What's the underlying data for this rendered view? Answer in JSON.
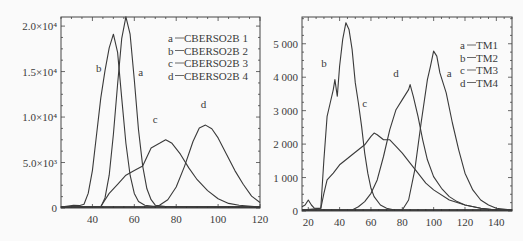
{
  "chart_data": [
    {
      "type": "line",
      "title": "",
      "xlabel": "",
      "ylabel": "",
      "xlim": [
        25,
        120
      ],
      "ylim": [
        0,
        21000
      ],
      "x_ticks": [
        40,
        60,
        80,
        100,
        120
      ],
      "y_ticks": [
        {
          "value": 0,
          "label": "0"
        },
        {
          "value": 5000,
          "label": "5.0×10³"
        },
        {
          "value": 10000,
          "label": "1.0×10⁴"
        },
        {
          "value": 15000,
          "label": "1.5×10⁴"
        },
        {
          "value": 20000,
          "label": "2.0×10⁴"
        }
      ],
      "grid": false,
      "legend_position": "upper right",
      "legend": [
        {
          "key": "a",
          "text": "CBERSO2B 1"
        },
        {
          "key": "b",
          "text": "CBERSO2B 2"
        },
        {
          "key": "c",
          "text": "CBERSO2B 3"
        },
        {
          "key": "d",
          "text": "CBERSO2B 4"
        }
      ],
      "series": [
        {
          "name": "a",
          "label": "CBERSO2B 1",
          "label_pos": [
            63,
            14500
          ],
          "x": [
            25,
            44,
            46,
            48,
            50,
            52,
            54,
            56,
            58,
            60,
            62,
            64,
            66,
            68,
            70,
            75,
            120
          ],
          "values": [
            0,
            0,
            1000,
            3500,
            8000,
            13500,
            18500,
            20900,
            19000,
            14000,
            8500,
            4500,
            2000,
            800,
            200,
            50,
            0
          ]
        },
        {
          "name": "b",
          "label": "CBERSO2B 2",
          "label_pos": [
            43,
            15000
          ],
          "x": [
            25,
            31,
            34,
            36,
            38,
            40,
            42,
            44,
            46,
            48,
            50,
            52,
            54,
            56,
            58,
            60,
            62,
            65,
            70,
            120
          ],
          "values": [
            0,
            200,
            150,
            300,
            1500,
            4000,
            8000,
            12000,
            15000,
            17500,
            19000,
            17000,
            12000,
            7000,
            3500,
            1500,
            600,
            200,
            50,
            0
          ]
        },
        {
          "name": "c",
          "label": "CBERSO2B 3",
          "label_pos": [
            70,
            9300
          ],
          "x": [
            25,
            44,
            48,
            52,
            56,
            60,
            64,
            68,
            72,
            75,
            78,
            82,
            86,
            90,
            95,
            100,
            105,
            110,
            120
          ],
          "values": [
            0,
            50,
            1500,
            2500,
            3500,
            4000,
            4500,
            6500,
            7000,
            7400,
            7000,
            5800,
            4300,
            3000,
            1800,
            900,
            400,
            200,
            0
          ]
        },
        {
          "name": "d",
          "label": "CBERSO2B 4",
          "label_pos": [
            93,
            11000
          ],
          "x": [
            25,
            68,
            72,
            76,
            80,
            84,
            88,
            91,
            94,
            97,
            100,
            104,
            108,
            112,
            116,
            120
          ],
          "values": [
            0,
            0,
            200,
            800,
            2200,
            4500,
            7200,
            8700,
            9000,
            8600,
            7600,
            5800,
            4000,
            2500,
            1200,
            500
          ]
        }
      ]
    },
    {
      "type": "line",
      "title": "",
      "xlabel": "",
      "ylabel": "",
      "xlim": [
        16,
        150
      ],
      "ylim": [
        0,
        5800
      ],
      "x_ticks": [
        20,
        40,
        60,
        80,
        100,
        120,
        140
      ],
      "y_ticks": [
        {
          "value": 0,
          "label": "0"
        },
        {
          "value": 1000,
          "label": "1 000"
        },
        {
          "value": 2000,
          "label": "2 000"
        },
        {
          "value": 3000,
          "label": "3 000"
        },
        {
          "value": 4000,
          "label": "4 000"
        },
        {
          "value": 5000,
          "label": "5 000"
        }
      ],
      "grid": false,
      "legend_position": "upper right",
      "legend": [
        {
          "key": "a",
          "text": "TM1"
        },
        {
          "key": "b",
          "text": "TM2"
        },
        {
          "key": "c",
          "text": "TM3"
        },
        {
          "key": "d",
          "text": "TM4"
        }
      ],
      "series": [
        {
          "name": "a",
          "label": "TM1",
          "label_pos": [
            110,
            4000
          ],
          "x": [
            16,
            80,
            84,
            88,
            92,
            96,
            98,
            100,
            102,
            104,
            108,
            112,
            116,
            120,
            125,
            130,
            135,
            140,
            150
          ],
          "values": [
            0,
            0,
            300,
            1200,
            2600,
            3900,
            4300,
            4750,
            4600,
            4100,
            3500,
            2600,
            1800,
            1100,
            600,
            300,
            150,
            50,
            0
          ]
        },
        {
          "name": "b",
          "label": "TM2",
          "label_pos": [
            30,
            4300
          ],
          "x": [
            16,
            18,
            20,
            22,
            24,
            28,
            30,
            32,
            34,
            36,
            37,
            38.5,
            40,
            42,
            44,
            46,
            48,
            50,
            52,
            54,
            56,
            58,
            60,
            62,
            66,
            70,
            75,
            150
          ],
          "values": [
            100,
            150,
            300,
            150,
            50,
            50,
            1500,
            2800,
            3200,
            3600,
            3900,
            3400,
            4300,
            5100,
            5600,
            5400,
            4800,
            3800,
            3200,
            2500,
            1700,
            1100,
            650,
            400,
            150,
            50,
            0,
            0
          ]
        },
        {
          "name": "c",
          "label": "TM3",
          "label_pos": [
            56,
            3100
          ],
          "x": [
            16,
            28,
            30,
            32,
            36,
            40,
            44,
            48,
            52,
            56,
            60,
            62,
            64,
            68,
            72,
            76,
            80,
            85,
            90,
            95,
            100,
            110,
            120,
            130,
            140,
            150
          ],
          "values": [
            0,
            50,
            500,
            900,
            1100,
            1350,
            1500,
            1650,
            1800,
            1950,
            2200,
            2300,
            2250,
            2100,
            2100,
            1900,
            1700,
            1400,
            1100,
            800,
            600,
            300,
            150,
            50,
            0,
            0
          ]
        },
        {
          "name": "d",
          "label": "TM4",
          "label_pos": [
            76,
            4000
          ],
          "x": [
            16,
            48,
            52,
            56,
            60,
            64,
            68,
            72,
            76,
            80,
            84,
            85,
            87,
            90,
            93,
            96,
            100,
            105,
            110,
            115,
            120,
            130,
            140,
            150
          ],
          "values": [
            0,
            0,
            100,
            250,
            500,
            900,
            1600,
            2400,
            3000,
            3300,
            3600,
            3750,
            3400,
            2800,
            2100,
            1500,
            1000,
            650,
            400,
            250,
            150,
            50,
            0,
            0
          ]
        }
      ]
    }
  ],
  "panels": [
    {
      "plot": {
        "left": 61,
        "right": 260,
        "top": 17,
        "bottom": 208
      },
      "legend_x": 168,
      "legend_y": 42,
      "legend_dy": 12.5
    },
    {
      "plot": {
        "left": 302,
        "right": 512,
        "top": 17,
        "bottom": 211
      },
      "legend_x": 460,
      "legend_y": 49,
      "legend_dy": 12.5
    }
  ]
}
